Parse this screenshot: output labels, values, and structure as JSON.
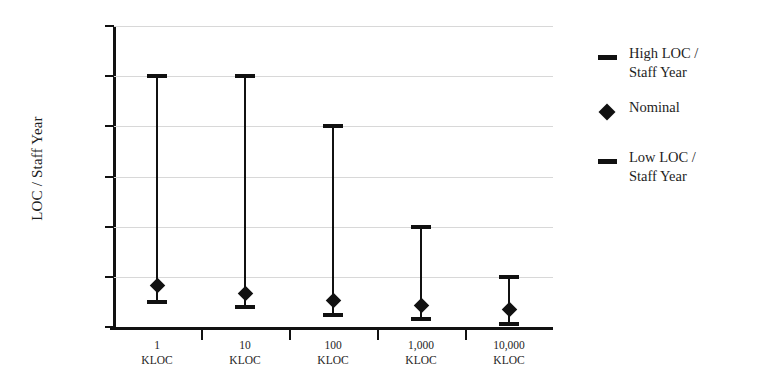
{
  "chart_data": {
    "type": "bar",
    "title": "",
    "subtitle": "",
    "xlabel": "",
    "ylabel": "LOC / Staff Year",
    "ylim": [
      0,
      30000
    ],
    "yticks": [
      0,
      5000,
      10000,
      15000,
      20000,
      25000,
      30000
    ],
    "ytick_labels": [
      "–",
      "5,000",
      "10,000",
      "15,000",
      "20,000",
      "25,000",
      "30,000"
    ],
    "grid": true,
    "legend_position": "right",
    "categories": [
      "1 KLOC",
      "10 KLOC",
      "100 KLOC",
      "1,000 KLOC",
      "10,000 KLOC"
    ],
    "category_lines": [
      {
        "l1": "1",
        "l2": "KLOC"
      },
      {
        "l1": "10",
        "l2": "KLOC"
      },
      {
        "l1": "100",
        "l2": "KLOC"
      },
      {
        "l1": "1,000",
        "l2": "KLOC"
      },
      {
        "l1": "10,000",
        "l2": "KLOC"
      }
    ],
    "series": [
      {
        "name": "High LOC / Staff Year",
        "marker": "dash",
        "values": [
          25000,
          25000,
          20000,
          10000,
          5000
        ]
      },
      {
        "name": "Nominal",
        "marker": "diamond",
        "values": [
          4100,
          3300,
          2600,
          2100,
          1700
        ]
      },
      {
        "name": "Low LOC / Staff Year",
        "marker": "dash",
        "values": [
          2500,
          2000,
          1200,
          800,
          300
        ]
      }
    ]
  },
  "axis": {
    "y_title": "LOC / Staff Year",
    "y_tick_labels": [
      "30,000",
      "25,000",
      "20,000",
      "15,000",
      "10,000",
      "5,000",
      "–"
    ]
  },
  "legend": {
    "items": [
      {
        "label": "High LOC /\nStaff Year",
        "marker": "dash"
      },
      {
        "label": "Nominal",
        "marker": "diamond"
      },
      {
        "label": "Low LOC /\nStaff Year",
        "marker": "dash"
      }
    ]
  },
  "colors": {
    "ink": "#111111",
    "grid": "#d8d8d8",
    "background": "#ffffff"
  }
}
